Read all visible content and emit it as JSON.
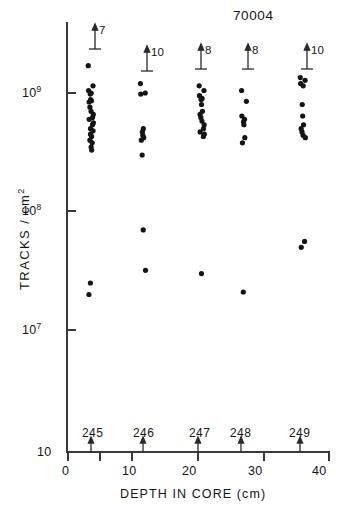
{
  "figure": {
    "id_label": "70004",
    "y_axis_title": "TRACKS / cm",
    "y_axis_title_sup": "2",
    "x_axis_title": "DEPTH  IN  CORE  (cm)",
    "y_ticks": [
      {
        "label_mantissa": "10",
        "label_exp": "9",
        "value": 1000000000
      },
      {
        "label_mantissa": "10",
        "label_exp": "8",
        "value": 100000000
      },
      {
        "label_mantissa": "10",
        "label_exp": "7",
        "value": 10000000
      },
      {
        "label_mantissa": "10",
        "label_exp": "",
        "value": 1000000
      }
    ],
    "x_ticks": [
      "0",
      "10",
      "20",
      "30",
      "40"
    ],
    "sample_labels": [
      "245",
      "246",
      "247",
      "248",
      "249"
    ],
    "upper_limit_counts": [
      "7",
      "10",
      "8",
      "8",
      "10"
    ],
    "axis_color": "#3a3a3a",
    "marker_color": "#141414"
  },
  "chart_data": {
    "type": "scatter",
    "title": "70004",
    "xlabel": "DEPTH IN CORE (cm)",
    "ylabel": "TRACKS / cm2",
    "yscale": "log",
    "ylim": [
      1000000,
      3000000000
    ],
    "xlim": [
      0,
      40
    ],
    "xticks": [
      0,
      5,
      10,
      20,
      30,
      40
    ],
    "xticklabels": [
      "0",
      "",
      "10",
      "20",
      "30",
      "40"
    ],
    "yticks": [
      1000000000,
      100000000,
      10000000,
      1000000
    ],
    "yticklabels": [
      "10^9",
      "10^8",
      "10^7",
      "10"
    ],
    "grid": false,
    "legend": false,
    "annotations": [
      {
        "text": "70004",
        "x": 30.5,
        "y": 2600000000,
        "role": "sample-id"
      }
    ],
    "series": [
      {
        "name": "245",
        "depth_cm": 3.5,
        "arrow_label": "7",
        "arrow_note": "7 tracks above plotted range (upper limit arrow)",
        "values": [
          1700000000,
          1150000000,
          1050000000,
          1000000000,
          980000000,
          880000000,
          860000000,
          840000000,
          760000000,
          700000000,
          660000000,
          620000000,
          600000000,
          560000000,
          540000000,
          500000000,
          480000000,
          450000000,
          430000000,
          400000000,
          380000000,
          350000000,
          330000000,
          25000000,
          20000000
        ]
      },
      {
        "name": "246",
        "depth_cm": 11.5,
        "arrow_label": "10",
        "arrow_note": "10 tracks above plotted range (upper limit arrow)",
        "values": [
          1200000000,
          1000000000,
          980000000,
          500000000,
          470000000,
          440000000,
          420000000,
          400000000,
          300000000,
          70000000,
          32000000
        ]
      },
      {
        "name": "247",
        "depth_cm": 20.5,
        "arrow_label": "8",
        "arrow_note": "8 tracks above plotted range (upper limit arrow)",
        "values": [
          1150000000,
          1050000000,
          950000000,
          900000000,
          880000000,
          800000000,
          700000000,
          660000000,
          620000000,
          580000000,
          540000000,
          500000000,
          470000000,
          450000000,
          430000000,
          30000000
        ]
      },
      {
        "name": "248",
        "depth_cm": 27.0,
        "arrow_label": "8",
        "arrow_note": "8 tracks above plotted range (upper limit arrow)",
        "values": [
          1050000000,
          850000000,
          640000000,
          600000000,
          570000000,
          540000000,
          420000000,
          380000000,
          21000000
        ]
      },
      {
        "name": "249",
        "depth_cm": 36.0,
        "arrow_label": "10",
        "arrow_note": "10 tracks above plotted range (upper limit arrow)",
        "values": [
          1350000000,
          1280000000,
          1200000000,
          1150000000,
          800000000,
          640000000,
          540000000,
          500000000,
          470000000,
          440000000,
          420000000,
          56000000,
          50000000
        ]
      }
    ]
  }
}
